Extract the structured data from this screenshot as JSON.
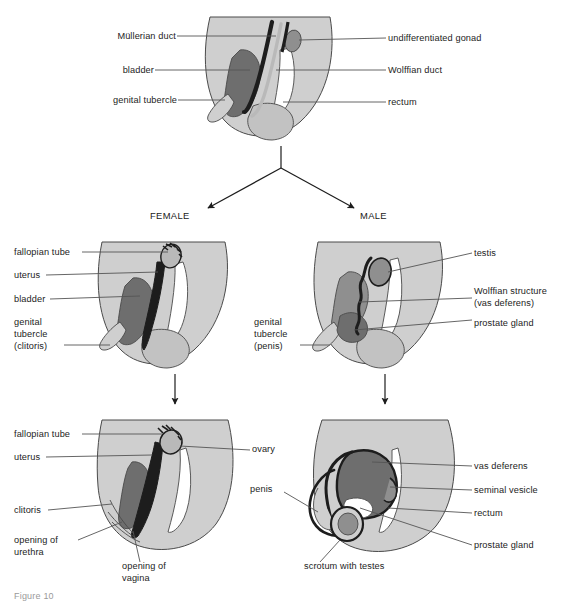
{
  "figure": {
    "caption_partial": "Figure 10",
    "colors": {
      "body_fill": "#cfcfcf",
      "organ_light": "#b9b9b9",
      "organ_mid": "#8f8f8f",
      "organ_dark": "#6e6e6e",
      "organ_black": "#1d1d1d",
      "white_fill": "#ffffff",
      "outline": "#4a4a4a",
      "leader": "#555555",
      "text": "#232323"
    }
  },
  "panels": {
    "indifferent": {
      "name": "undifferentiated stage",
      "labels_left": [
        {
          "text": "Müllerian duct",
          "x": 108,
          "y": 32
        },
        {
          "text": "bladder",
          "x": 123,
          "y": 66
        },
        {
          "text": "genital tubercle",
          "x": 99,
          "y": 96
        }
      ],
      "labels_right": [
        {
          "text": "undifferentiated gonad",
          "x": 390,
          "y": 35
        },
        {
          "text": "Wolffian duct",
          "x": 390,
          "y": 67
        },
        {
          "text": "rectum",
          "x": 390,
          "y": 99
        }
      ]
    },
    "branch": {
      "female_label": "FEMALE",
      "male_label": "MALE"
    },
    "female_fetal": {
      "name": "female fetal stage",
      "labels": [
        {
          "text": "fallopian tube",
          "x": 14,
          "y": 248
        },
        {
          "text": "uterus",
          "x": 14,
          "y": 271
        },
        {
          "text": "bladder",
          "x": 14,
          "y": 295
        },
        {
          "text": "genital",
          "x": 14,
          "y": 318
        },
        {
          "text": "tubercle",
          "x": 14,
          "y": 330
        },
        {
          "text": "(clitoris)",
          "x": 14,
          "y": 342
        }
      ]
    },
    "male_fetal": {
      "name": "male fetal stage",
      "labels_left": [
        {
          "text": "genital",
          "x": 256,
          "y": 318
        },
        {
          "text": "tubercle",
          "x": 256,
          "y": 330
        },
        {
          "text": "(penis)",
          "x": 256,
          "y": 342
        }
      ],
      "labels_right": [
        {
          "text": "testis",
          "x": 476,
          "y": 250
        },
        {
          "text": "Wolffian structure",
          "x": 476,
          "y": 288
        },
        {
          "text": "(vas deferens)",
          "x": 476,
          "y": 300
        },
        {
          "text": "prostate gland",
          "x": 476,
          "y": 320
        }
      ]
    },
    "female_adult": {
      "name": "adult female",
      "labels_left": [
        {
          "text": "fallopian tube",
          "x": 14,
          "y": 430
        },
        {
          "text": "uterus",
          "x": 14,
          "y": 453
        },
        {
          "text": "clitoris",
          "x": 14,
          "y": 506
        },
        {
          "text": "opening of",
          "x": 14,
          "y": 540
        },
        {
          "text": "urethra",
          "x": 14,
          "y": 552
        }
      ],
      "labels_right": [
        {
          "text": "ovary",
          "x": 254,
          "y": 447
        }
      ],
      "labels_bottom": [
        {
          "text": "opening of",
          "x": 124,
          "y": 566
        },
        {
          "text": "vagina",
          "x": 124,
          "y": 578
        }
      ]
    },
    "male_adult": {
      "name": "adult male",
      "labels_left": [
        {
          "text": "penis",
          "x": 252,
          "y": 486
        }
      ],
      "labels_right": [
        {
          "text": "vas deferens",
          "x": 476,
          "y": 463
        },
        {
          "text": "seminal vesicle",
          "x": 476,
          "y": 487
        },
        {
          "text": "rectum",
          "x": 476,
          "y": 510
        },
        {
          "text": "prostate gland",
          "x": 476,
          "y": 542
        }
      ],
      "labels_bottom": [
        {
          "text": "scrotum with testes",
          "x": 306,
          "y": 566
        }
      ]
    }
  }
}
